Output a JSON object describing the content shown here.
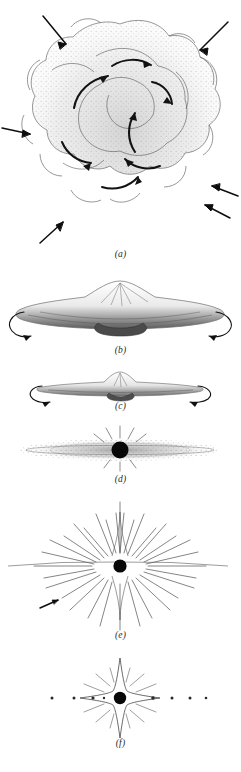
{
  "figure": {
    "orientation": "vertical six-panel sequence",
    "background_color": "#ffffff",
    "ink_color": "#2b2b2b",
    "core_color": "#080808"
  },
  "panels": [
    {
      "id": "a",
      "caption": "(a)",
      "caption_y": 256,
      "description": "Irregular lobed interstellar cloud with stippled interior, inward infall arrows around the perimeter and interior swirl arrows indicating turbulent rotation",
      "infall_arrow_count": 6,
      "swirl_arrow_count": 7,
      "lobe_count": 13
    },
    {
      "id": "b",
      "caption": "(b)",
      "caption_y": 352,
      "description": "Cloud flattened into a lens-shaped rotating disk with a central bulge; curved rotation arrows at both outer edges",
      "rotation_arrow_count": 2
    },
    {
      "id": "c",
      "caption": "(c)",
      "caption_y": 408,
      "description": "Thinner, more flattened disk with a small central condensation; rotation arrows at both ends",
      "rotation_arrow_count": 2
    },
    {
      "id": "d",
      "caption": "(d)",
      "caption_y": 481,
      "description": "Thin stippled nebular disk with a dark protostar at the center emitting short radial rays",
      "has_protostar": true
    },
    {
      "id": "e",
      "caption": "(e)",
      "caption_y": 637,
      "description": "T Tauri stage: strong radial outflow of rays from the central star clearing the remaining nebula; residual disk plane visible as a horizontal line",
      "ray_count": 40,
      "has_protostar": true
    },
    {
      "id": "f",
      "caption": "(f)",
      "caption_y": 745,
      "description": "Finished planetary system: central star with four-point flare and planets spaced along the orbital plane",
      "planet_count": 8,
      "has_star": true
    }
  ]
}
